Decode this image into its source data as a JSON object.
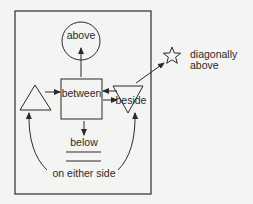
{
  "diagram": {
    "colors": {
      "background": "#f4f4f2",
      "stroke": "#2a2a2a"
    },
    "labels": {
      "above": "above",
      "between": "between",
      "beside": "beside",
      "below": "below",
      "on_either_side": "on either side",
      "diagonally_line1": "diagonally",
      "diagonally_line2": "above"
    },
    "shapes": [
      {
        "id": "frame",
        "type": "rectangle"
      },
      {
        "id": "circle",
        "type": "circle",
        "label": "above"
      },
      {
        "id": "box",
        "type": "square",
        "label": "between"
      },
      {
        "id": "triangle-left",
        "type": "triangle"
      },
      {
        "id": "triangle-right",
        "type": "inverted-triangle",
        "label": "beside"
      },
      {
        "id": "star",
        "type": "star",
        "label": "diagonally above"
      },
      {
        "id": "lines",
        "type": "double-line",
        "label": "below"
      }
    ]
  }
}
